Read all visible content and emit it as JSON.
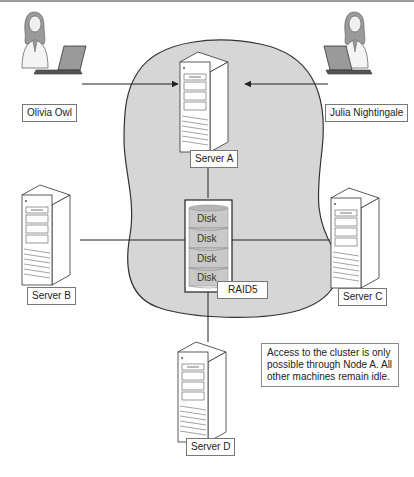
{
  "diagram": {
    "colors": {
      "cluster_fill": "#d6d6d6",
      "cluster_stroke": "#333333",
      "line": "#222222",
      "server_fill": "#ffffff",
      "disk_fill": "#c9c9c9",
      "top_bar": "#9a9a9a"
    },
    "users": [
      {
        "name": "Olivia Owl",
        "icon": "woman-with-laptop-icon"
      },
      {
        "name": "Julia Nightingale",
        "icon": "woman-with-laptop-icon"
      }
    ],
    "servers": {
      "a": "Server A",
      "b": "Server B",
      "c": "Server C",
      "d": "Server D"
    },
    "storage": {
      "disks": [
        "Disk",
        "Disk",
        "Disk",
        "Disk"
      ],
      "label": "RAID5"
    },
    "note": "Access to the cluster is only possible through Node A. All other machines remain idle."
  }
}
